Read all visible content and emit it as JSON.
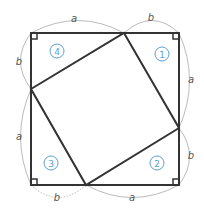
{
  "diagram": {
    "colors": {
      "line": "#333333",
      "arc": "#bbbbbb",
      "label": "#555555",
      "accent": "#5a9fd4"
    },
    "side_labels": {
      "top_a": "a",
      "top_b": "b",
      "right_a": "a",
      "right_b": "b",
      "bottom_a": "a",
      "bottom_b": "b",
      "left_a": "a",
      "left_b": "b"
    },
    "triangles": [
      {
        "id": "1",
        "position": "top-right"
      },
      {
        "id": "2",
        "position": "bottom-right"
      },
      {
        "id": "3",
        "position": "bottom-left"
      },
      {
        "id": "4",
        "position": "top-left"
      }
    ]
  }
}
